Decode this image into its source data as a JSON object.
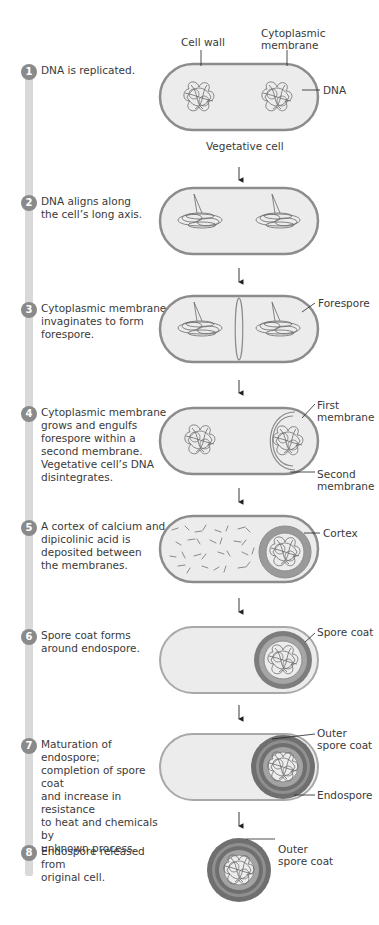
{
  "steps": [
    {
      "number": "1",
      "text": "DNA is replicated."
    },
    {
      "number": "2",
      "text": "DNA aligns along\nthe cell’s long axis."
    },
    {
      "number": "3",
      "text": "Cytoplasmic membrane\ninvaginates to form\nforespore."
    },
    {
      "number": "4",
      "text": "Cytoplasmic membrane\ngrows and engulfs\nforespore within a\nsecond membrane.\nVegetative cell’s DNA\ndisintegrates."
    },
    {
      "number": "5",
      "text": "A cortex of calcium and\ndipicolinic acid is\ndeposited between\nthe membranes."
    },
    {
      "number": "6",
      "text": "Spore coat forms\naround endospore."
    },
    {
      "number": "7",
      "text": "Maturation of endospore;\ncompletion of spore coat\nand increase in resistance\nto heat and chemicals by\nunknown process."
    },
    {
      "number": "8",
      "text": "Endospore released from\noriginal cell."
    }
  ],
  "labels": {
    "cell_wall": "Cell wall",
    "cytoplasmic_membrane": "Cytoplasmic\nmembrane",
    "dna": "DNA",
    "vegetative_cell": "Vegetative cell",
    "forespore": "Forespore",
    "first_membrane": "First\nmembrane",
    "second_membrane": "Second\nmembrane",
    "cortex": "Cortex",
    "spore_coat": "Spore coat",
    "outer_spore_coat_7": "Outer\nspore coat",
    "endospore": "Endospore",
    "outer_spore_coat_8": "Outer\nspore coat"
  },
  "colors": {
    "cell_outline": "#8c8c8c",
    "cell_fill": "#ececec",
    "dna": "#6a6a6a",
    "number_badge": "#8a8a8a",
    "timeline_bar": "#d9d9d9",
    "cortex": "#9a9a9a",
    "spore_coat": "#7d7d7d"
  }
}
